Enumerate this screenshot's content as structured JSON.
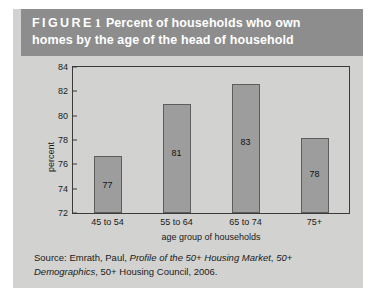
{
  "figure": {
    "label_word": "FIGURE",
    "label_number": "1",
    "title_line1": "Percent of households who own",
    "title_line2": "homes by the age of the head of household",
    "header_bg": "#8d8d8d",
    "panel_bg": "#d2d2d0"
  },
  "chart_data": {
    "type": "bar",
    "title": "Percent of households who own homes by the age of the head of household",
    "categories": [
      "45 to 54",
      "55 to 64",
      "65 to 74",
      "75+"
    ],
    "values": [
      77,
      81,
      83,
      78
    ],
    "bar_tops": [
      76.7,
      81.0,
      82.6,
      78.2
    ],
    "data_labels": [
      "77",
      "81",
      "83",
      "78"
    ],
    "xlabel": "age group of households",
    "ylabel": "percent",
    "ylim": [
      72,
      84
    ],
    "yticks": [
      72,
      74,
      76,
      78,
      80,
      82,
      84
    ],
    "ytick_labels": [
      "72",
      "74",
      "76",
      "78",
      "80",
      "82",
      "84"
    ],
    "grid": false,
    "legend": null,
    "bar_color": "#9d9d9d",
    "bar_edge_color": "#5d5d5d",
    "axis_color": "#3b3b3b"
  },
  "source": {
    "line1_prefix": "Source: Emrath, Paul, ",
    "line1_italic": "Profile of the 50+ Housing Market",
    "line1_suffix": ",",
    "line2_italic": "50+ Demographics",
    "line2_suffix": ", 50+ Housing Council, 2006."
  }
}
